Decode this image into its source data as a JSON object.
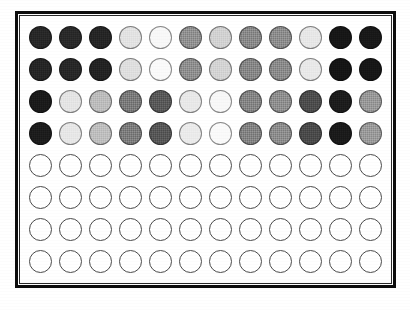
{
  "figure": {
    "type": "well-plate-grid",
    "background_color": "#ffffff",
    "frame_color": "#0d0d0d",
    "frame_thickness_px": 3,
    "columns": 12,
    "rows": 8,
    "well_shape": "circle",
    "well_diameter_px": 23,
    "empty_well_outline_color": "#4a4a4a",
    "filled_well_outline_color": "#3a3a3a"
  },
  "chart_data": {
    "type": "heatmap",
    "title": "",
    "xlabel": "",
    "ylabel": "",
    "grid": false,
    "legend_position": "none",
    "colorscale": "grayscale",
    "value_units": "gray level (0 = black, 255 = white)",
    "categories": [
      "1",
      "2",
      "3",
      "4",
      "5",
      "6",
      "7",
      "8",
      "9",
      "10",
      "11",
      "12"
    ],
    "row_labels": [
      "A",
      "B",
      "C",
      "D",
      "E",
      "F",
      "G",
      "H"
    ],
    "series": [
      {
        "name": "A",
        "values": [
          38,
          40,
          36,
          226,
          247,
          140,
          208,
          132,
          136,
          230,
          22,
          24
        ]
      },
      {
        "name": "B",
        "values": [
          36,
          38,
          34,
          222,
          249,
          138,
          210,
          130,
          134,
          232,
          20,
          22
        ]
      },
      {
        "name": "C",
        "values": [
          26,
          228,
          186,
          118,
          86,
          232,
          247,
          128,
          138,
          74,
          28,
          148
        ]
      },
      {
        "name": "D",
        "values": [
          28,
          230,
          188,
          120,
          84,
          234,
          249,
          126,
          136,
          72,
          26,
          150
        ]
      },
      {
        "name": "E",
        "values": [
          255,
          255,
          255,
          255,
          255,
          255,
          255,
          255,
          255,
          255,
          255,
          255
        ]
      },
      {
        "name": "F",
        "values": [
          255,
          255,
          255,
          255,
          255,
          255,
          255,
          255,
          255,
          255,
          255,
          255
        ]
      },
      {
        "name": "G",
        "values": [
          255,
          255,
          255,
          255,
          255,
          255,
          255,
          255,
          255,
          255,
          255,
          255
        ]
      },
      {
        "name": "H",
        "values": [
          255,
          255,
          255,
          255,
          255,
          255,
          255,
          255,
          255,
          255,
          255,
          255
        ]
      }
    ],
    "cells": [
      {
        "row": "A",
        "wells": [
          {
            "col": 1,
            "state": "filled",
            "color": "#262626"
          },
          {
            "col": 2,
            "state": "filled",
            "color": "#282828"
          },
          {
            "col": 3,
            "state": "filled",
            "color": "#242424"
          },
          {
            "col": 4,
            "state": "filled",
            "color": "#e2e2e2"
          },
          {
            "col": 5,
            "state": "filled",
            "color": "#f7f7f7"
          },
          {
            "col": 6,
            "state": "filled",
            "color": "#8c8c8c"
          },
          {
            "col": 7,
            "state": "filled",
            "color": "#d0d0d0"
          },
          {
            "col": 8,
            "state": "filled",
            "color": "#848484"
          },
          {
            "col": 9,
            "state": "filled",
            "color": "#888888"
          },
          {
            "col": 10,
            "state": "filled",
            "color": "#e6e6e6"
          },
          {
            "col": 11,
            "state": "filled",
            "color": "#161616"
          },
          {
            "col": 12,
            "state": "filled",
            "color": "#181818"
          }
        ]
      },
      {
        "row": "B",
        "wells": [
          {
            "col": 1,
            "state": "filled",
            "color": "#242424"
          },
          {
            "col": 2,
            "state": "filled",
            "color": "#262626"
          },
          {
            "col": 3,
            "state": "filled",
            "color": "#222222"
          },
          {
            "col": 4,
            "state": "filled",
            "color": "#dedede"
          },
          {
            "col": 5,
            "state": "filled",
            "color": "#f9f9f9"
          },
          {
            "col": 6,
            "state": "filled",
            "color": "#8a8a8a"
          },
          {
            "col": 7,
            "state": "filled",
            "color": "#d2d2d2"
          },
          {
            "col": 8,
            "state": "filled",
            "color": "#828282"
          },
          {
            "col": 9,
            "state": "filled",
            "color": "#868686"
          },
          {
            "col": 10,
            "state": "filled",
            "color": "#e8e8e8"
          },
          {
            "col": 11,
            "state": "filled",
            "color": "#141414"
          },
          {
            "col": 12,
            "state": "filled",
            "color": "#161616"
          }
        ]
      },
      {
        "row": "C",
        "wells": [
          {
            "col": 1,
            "state": "filled",
            "color": "#1a1a1a"
          },
          {
            "col": 2,
            "state": "filled",
            "color": "#e4e4e4"
          },
          {
            "col": 3,
            "state": "filled",
            "color": "#bababa"
          },
          {
            "col": 4,
            "state": "filled",
            "color": "#767676"
          },
          {
            "col": 5,
            "state": "filled",
            "color": "#565656"
          },
          {
            "col": 6,
            "state": "filled",
            "color": "#e8e8e8"
          },
          {
            "col": 7,
            "state": "filled",
            "color": "#f7f7f7"
          },
          {
            "col": 8,
            "state": "filled",
            "color": "#808080"
          },
          {
            "col": 9,
            "state": "filled",
            "color": "#8a8a8a"
          },
          {
            "col": 10,
            "state": "filled",
            "color": "#4a4a4a"
          },
          {
            "col": 11,
            "state": "filled",
            "color": "#1c1c1c"
          },
          {
            "col": 12,
            "state": "filled",
            "color": "#949494"
          }
        ]
      },
      {
        "row": "D",
        "wells": [
          {
            "col": 1,
            "state": "filled",
            "color": "#1c1c1c"
          },
          {
            "col": 2,
            "state": "filled",
            "color": "#e6e6e6"
          },
          {
            "col": 3,
            "state": "filled",
            "color": "#bcbcbc"
          },
          {
            "col": 4,
            "state": "filled",
            "color": "#787878"
          },
          {
            "col": 5,
            "state": "filled",
            "color": "#545454"
          },
          {
            "col": 6,
            "state": "filled",
            "color": "#eaeaea"
          },
          {
            "col": 7,
            "state": "filled",
            "color": "#f9f9f9"
          },
          {
            "col": 8,
            "state": "filled",
            "color": "#7e7e7e"
          },
          {
            "col": 9,
            "state": "filled",
            "color": "#888888"
          },
          {
            "col": 10,
            "state": "filled",
            "color": "#484848"
          },
          {
            "col": 11,
            "state": "filled",
            "color": "#1a1a1a"
          },
          {
            "col": 12,
            "state": "filled",
            "color": "#969696"
          }
        ]
      },
      {
        "row": "E",
        "wells": [
          {
            "col": 1,
            "state": "empty",
            "color": "#ffffff"
          },
          {
            "col": 2,
            "state": "empty",
            "color": "#ffffff"
          },
          {
            "col": 3,
            "state": "empty",
            "color": "#ffffff"
          },
          {
            "col": 4,
            "state": "empty",
            "color": "#ffffff"
          },
          {
            "col": 5,
            "state": "empty",
            "color": "#ffffff"
          },
          {
            "col": 6,
            "state": "empty",
            "color": "#ffffff"
          },
          {
            "col": 7,
            "state": "empty",
            "color": "#ffffff"
          },
          {
            "col": 8,
            "state": "empty",
            "color": "#ffffff"
          },
          {
            "col": 9,
            "state": "empty",
            "color": "#ffffff"
          },
          {
            "col": 10,
            "state": "empty",
            "color": "#ffffff"
          },
          {
            "col": 11,
            "state": "empty",
            "color": "#ffffff"
          },
          {
            "col": 12,
            "state": "empty",
            "color": "#ffffff"
          }
        ]
      },
      {
        "row": "F",
        "wells": [
          {
            "col": 1,
            "state": "empty",
            "color": "#ffffff"
          },
          {
            "col": 2,
            "state": "empty",
            "color": "#ffffff"
          },
          {
            "col": 3,
            "state": "empty",
            "color": "#ffffff"
          },
          {
            "col": 4,
            "state": "empty",
            "color": "#ffffff"
          },
          {
            "col": 5,
            "state": "empty",
            "color": "#ffffff"
          },
          {
            "col": 6,
            "state": "empty",
            "color": "#ffffff"
          },
          {
            "col": 7,
            "state": "empty",
            "color": "#ffffff"
          },
          {
            "col": 8,
            "state": "empty",
            "color": "#ffffff"
          },
          {
            "col": 9,
            "state": "empty",
            "color": "#ffffff"
          },
          {
            "col": 10,
            "state": "empty",
            "color": "#ffffff"
          },
          {
            "col": 11,
            "state": "empty",
            "color": "#ffffff"
          },
          {
            "col": 12,
            "state": "empty",
            "color": "#ffffff"
          }
        ]
      },
      {
        "row": "G",
        "wells": [
          {
            "col": 1,
            "state": "empty",
            "color": "#ffffff"
          },
          {
            "col": 2,
            "state": "empty",
            "color": "#ffffff"
          },
          {
            "col": 3,
            "state": "empty",
            "color": "#ffffff"
          },
          {
            "col": 4,
            "state": "empty",
            "color": "#ffffff"
          },
          {
            "col": 5,
            "state": "empty",
            "color": "#ffffff"
          },
          {
            "col": 6,
            "state": "empty",
            "color": "#ffffff"
          },
          {
            "col": 7,
            "state": "empty",
            "color": "#ffffff"
          },
          {
            "col": 8,
            "state": "empty",
            "color": "#ffffff"
          },
          {
            "col": 9,
            "state": "empty",
            "color": "#ffffff"
          },
          {
            "col": 10,
            "state": "empty",
            "color": "#ffffff"
          },
          {
            "col": 11,
            "state": "empty",
            "color": "#ffffff"
          },
          {
            "col": 12,
            "state": "empty",
            "color": "#ffffff"
          }
        ]
      },
      {
        "row": "H",
        "wells": [
          {
            "col": 1,
            "state": "empty",
            "color": "#ffffff"
          },
          {
            "col": 2,
            "state": "empty",
            "color": "#ffffff"
          },
          {
            "col": 3,
            "state": "empty",
            "color": "#ffffff"
          },
          {
            "col": 4,
            "state": "empty",
            "color": "#ffffff"
          },
          {
            "col": 5,
            "state": "empty",
            "color": "#ffffff"
          },
          {
            "col": 6,
            "state": "empty",
            "color": "#ffffff"
          },
          {
            "col": 7,
            "state": "empty",
            "color": "#ffffff"
          },
          {
            "col": 8,
            "state": "empty",
            "color": "#ffffff"
          },
          {
            "col": 9,
            "state": "empty",
            "color": "#ffffff"
          },
          {
            "col": 10,
            "state": "empty",
            "color": "#ffffff"
          },
          {
            "col": 11,
            "state": "empty",
            "color": "#ffffff"
          },
          {
            "col": 12,
            "state": "empty",
            "color": "#ffffff"
          }
        ]
      }
    ]
  }
}
